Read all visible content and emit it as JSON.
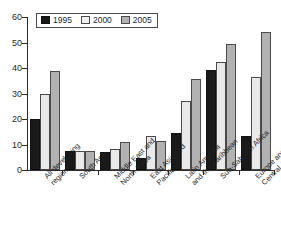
{
  "chart_data": {
    "type": "bar",
    "title": "",
    "xlabel": "",
    "ylabel": "",
    "ylim": [
      0,
      60
    ],
    "yticks": [
      0,
      10,
      20,
      30,
      40,
      50,
      60
    ],
    "grid": false,
    "legend_position": "top-left",
    "categories": [
      "All developing regions",
      "South Asia",
      "Middle East and North Africa",
      "East Asia and Pacific",
      "Latin America and the Caribbean",
      "Sub-Saharan Africa",
      "Europe and Central Asia"
    ],
    "category_lines": [
      [
        "All developing",
        "regions"
      ],
      [
        "South Asia"
      ],
      [
        "Middle East and",
        "North Africa"
      ],
      [
        "East Asia and",
        "Pacific"
      ],
      [
        "Latin America",
        "and the Caribbean"
      ],
      [
        "Sub-Saharan Africa"
      ],
      [
        "Europe and",
        "Central Asia"
      ]
    ],
    "series": [
      {
        "name": "1995",
        "color": "#1a1a1a",
        "values": [
          20.0,
          7.3,
          6.9,
          4.6,
          14.7,
          39.4,
          13.3
        ]
      },
      {
        "name": "2000",
        "color": "#e9e9e9",
        "values": [
          30.0,
          7.4,
          8.3,
          13.4,
          27.0,
          42.5,
          36.3
        ]
      },
      {
        "name": "2005",
        "color": "#b2b2b2",
        "values": [
          38.8,
          7.5,
          10.9,
          11.2,
          35.5,
          49.4,
          54.3
        ]
      }
    ]
  },
  "legend": {
    "items": [
      {
        "label": "1995"
      },
      {
        "label": "2000"
      },
      {
        "label": "2005"
      }
    ]
  },
  "axis": {
    "y_tick_labels": [
      "0",
      "10",
      "20",
      "30",
      "40",
      "50",
      "60"
    ]
  }
}
